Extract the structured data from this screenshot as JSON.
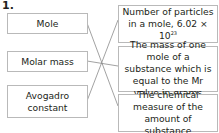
{
  "question_number": "1.",
  "left_terms": [
    {
      "label": "Mole"
    },
    {
      "label": "Molar mass"
    },
    {
      "label": "Avogadro constant"
    }
  ],
  "right_definitions": [
    {
      "label": "Number of particles in a mole, 6.02 × 10",
      "superscript": "23"
    },
    {
      "label": "The mass of one mole of a substance which is equal to the Mr value in grams"
    },
    {
      "label": "The chemical measure of the amount of substance"
    }
  ],
  "matches": [
    {
      "term": "Mole",
      "definition": "The chemical measure of the amount of substance"
    },
    {
      "term": "Molar mass",
      "definition": "The mass of one mole of a substance which is equal to the Mr value in grams"
    },
    {
      "term": "Avogadro constant",
      "definition": "Number of particles in a mole, 6.02 × 10^23"
    }
  ],
  "colors": {
    "box_border": "#b9b9b9",
    "line": "#8a8a8a",
    "text": "#231f20"
  }
}
